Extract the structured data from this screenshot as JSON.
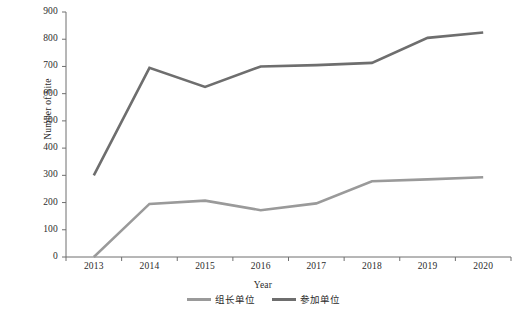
{
  "chart_data": {
    "type": "line",
    "title": "",
    "xlabel": "Year",
    "ylabel": "Number of Site",
    "categories": [
      "2013",
      "2014",
      "2015",
      "2016",
      "2017",
      "2018",
      "2019",
      "2020"
    ],
    "x": [
      2013,
      2014,
      2015,
      2016,
      2017,
      2018,
      2019,
      2020
    ],
    "ylim": [
      0,
      900
    ],
    "yticks": [
      0,
      100,
      200,
      300,
      400,
      500,
      600,
      700,
      800,
      900
    ],
    "grid": false,
    "legend_position": "bottom-center",
    "series": [
      {
        "name": "组长单位",
        "color": "#9a9a9a",
        "values": [
          0,
          195,
          207,
          172,
          197,
          278,
          285,
          293
        ]
      },
      {
        "name": "参加单位",
        "color": "#6e6e6e",
        "values": [
          300,
          695,
          625,
          700,
          705,
          713,
          805,
          825
        ]
      }
    ]
  },
  "axes": {
    "y_tick_labels": [
      "900",
      "800",
      "700",
      "600",
      "500",
      "400",
      "300",
      "200",
      "100",
      "0"
    ],
    "x_tick_labels": [
      "2013",
      "2014",
      "2015",
      "2016",
      "2017",
      "2018",
      "2019",
      "2020"
    ],
    "y_axis_title": "Number of Site",
    "x_axis_title": "Year",
    "axis_color": "#6f6f6f"
  },
  "legend": {
    "entries": [
      {
        "label": "组长单位",
        "color": "#9a9a9a"
      },
      {
        "label": "参加单位",
        "color": "#6e6e6e"
      }
    ]
  }
}
